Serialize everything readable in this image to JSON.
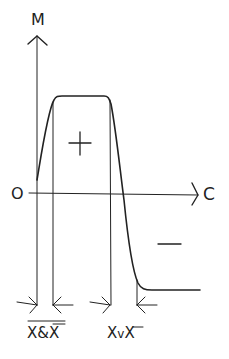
{
  "diagram": {
    "axes": {
      "y_label": "M",
      "x_label": "C",
      "origin_label": "O"
    },
    "regions": {
      "positive_sign": "+",
      "negative_sign": "−"
    },
    "markers": [
      {
        "label_overbar_all": "X&X",
        "parts": [
          "X",
          "&",
          "X"
        ],
        "overbar": "whole expression and second X"
      },
      {
        "label": "XvX",
        "parts": [
          "X",
          "v",
          "X"
        ],
        "overbar": "second X"
      }
    ]
  }
}
